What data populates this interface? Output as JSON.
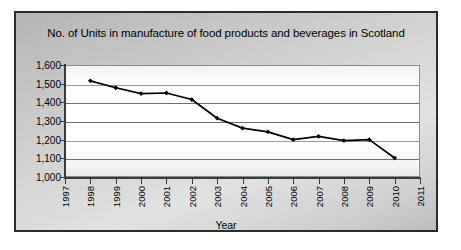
{
  "chart_data": {
    "type": "line",
    "title": "No. of Units in manufacture of food products and beverages in Scotland",
    "xlabel": "Year",
    "ylabel": "",
    "x": [
      1997,
      1998,
      1999,
      2000,
      2001,
      2002,
      2003,
      2004,
      2005,
      2006,
      2007,
      2008,
      2009,
      2010,
      2011
    ],
    "xtick_labels": [
      "1997",
      "1998",
      "1999",
      "2000",
      "2001",
      "2002",
      "2003",
      "2004",
      "2005",
      "2006",
      "2007",
      "2008",
      "2009",
      "2010",
      "2011"
    ],
    "ytick_labels": [
      "1,600",
      "1,500",
      "1,400",
      "1,300",
      "1,200",
      "1,100",
      "1,000"
    ],
    "ytick_values": [
      1600,
      1500,
      1400,
      1300,
      1200,
      1100,
      1000
    ],
    "ylim": [
      1000,
      1600
    ],
    "xlim": [
      1997,
      2011
    ],
    "grid": true,
    "legend": false,
    "series": [
      {
        "name": "No. of Units",
        "marker": "diamond",
        "color": "#000000",
        "points": [
          {
            "x": 1998,
            "y": 1515
          },
          {
            "x": 1999,
            "y": 1478
          },
          {
            "x": 2000,
            "y": 1447
          },
          {
            "x": 2001,
            "y": 1450
          },
          {
            "x": 2002,
            "y": 1415
          },
          {
            "x": 2003,
            "y": 1315
          },
          {
            "x": 2004,
            "y": 1262
          },
          {
            "x": 2005,
            "y": 1242
          },
          {
            "x": 2006,
            "y": 1200
          },
          {
            "x": 2007,
            "y": 1218
          },
          {
            "x": 2008,
            "y": 1195
          },
          {
            "x": 2009,
            "y": 1200
          },
          {
            "x": 2010,
            "y": 1102
          }
        ]
      }
    ]
  },
  "colors": {
    "frame_border": "#2b2b2b",
    "line": "#000000",
    "grid": "#6f6f6f",
    "axis": "#3a3a3a",
    "plot_background": "#ffffff",
    "figure_background": "#cfcfcf"
  }
}
